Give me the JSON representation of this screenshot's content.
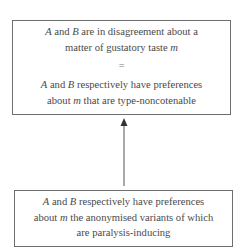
{
  "diagram": {
    "top_box": {
      "statement": {
        "lines": [
          {
            "var1": "A",
            "mid1": " and ",
            "var2": "B",
            "rest": " are in disagreement about a"
          },
          {
            "pre": "matter of gustatory taste ",
            "var": "m"
          }
        ]
      },
      "relation_symbol": "=",
      "definition": {
        "lines": [
          {
            "var1": "A",
            "mid1": " and ",
            "var2": "B",
            "rest": " respectively have preferences"
          },
          {
            "pre": "about ",
            "var": "m",
            "rest": " that are type-noncotenable"
          }
        ]
      }
    },
    "arrow": {
      "direction": "up",
      "from": "bottom_box",
      "to": "top_box",
      "color": "#555555"
    },
    "bottom_box": {
      "lines": [
        {
          "var1": "A",
          "mid1": " and ",
          "var2": "B",
          "rest": " respectively have preferences"
        },
        {
          "pre": "about ",
          "var": "m",
          "rest": " the anonymised variants of which"
        },
        {
          "text": "are paralysis-inducing"
        }
      ]
    },
    "colors": {
      "text": "#4a4a4a",
      "border": "#6e6e6e",
      "background": "#ffffff"
    }
  }
}
